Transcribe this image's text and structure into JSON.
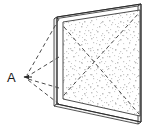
{
  "figure": {
    "background_color": "#ffffff",
    "line_color": "#2b2b2b",
    "dashed_color": "#555555",
    "panel_fill": "#ffffff",
    "speckle_color": "#b8b8b8",
    "labels": [
      {
        "id": "point-a",
        "text": "A",
        "x": 7,
        "y": 82
      }
    ],
    "viewpoint": {
      "name": "A",
      "x": 24,
      "y": 77
    },
    "panel": {
      "name": "screen",
      "outer_corners": [
        {
          "x": 57,
          "y": 17
        },
        {
          "x": 141,
          "y": 4
        },
        {
          "x": 141,
          "y": 122
        },
        {
          "x": 57,
          "y": 104
        }
      ],
      "inner_corners": [
        {
          "x": 63,
          "y": 22
        },
        {
          "x": 140,
          "y": 10
        },
        {
          "x": 140,
          "y": 116
        },
        {
          "x": 63,
          "y": 99
        }
      ],
      "edge_corners": [
        {
          "x": 54,
          "y": 19
        },
        {
          "x": 138,
          "y": 6
        },
        {
          "x": 138,
          "y": 124
        },
        {
          "x": 54,
          "y": 106
        }
      ]
    },
    "sight_lines": [
      {
        "name": "sight-line-top",
        "from": {
          "x": 24,
          "y": 77
        },
        "to": {
          "x": 59,
          "y": 19
        }
      },
      {
        "name": "sight-line-upper-mid",
        "from": {
          "x": 24,
          "y": 77
        },
        "to": {
          "x": 59,
          "y": 57
        }
      },
      {
        "name": "sight-line-lower-mid",
        "from": {
          "x": 24,
          "y": 77
        },
        "to": {
          "x": 59,
          "y": 88
        }
      },
      {
        "name": "sight-line-bottom",
        "from": {
          "x": 24,
          "y": 77
        },
        "to": {
          "x": 59,
          "y": 104
        }
      }
    ],
    "panel_diagonals": [
      {
        "name": "diagonal-upper",
        "from": {
          "x": 64,
          "y": 95
        },
        "to": {
          "x": 139,
          "y": 13
        }
      },
      {
        "name": "diagonal-lower",
        "from": {
          "x": 64,
          "y": 27
        },
        "to": {
          "x": 139,
          "y": 114
        }
      }
    ]
  }
}
